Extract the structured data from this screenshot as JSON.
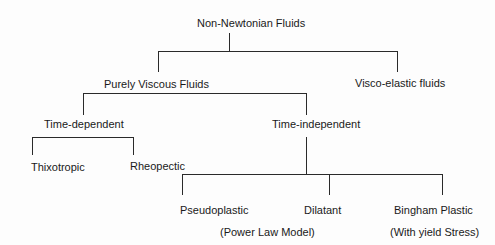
{
  "diagram": {
    "type": "tree",
    "root": {
      "label": "Non-Newtonian Fluids",
      "children": [
        {
          "label": "Purely Viscous Fluids",
          "children": [
            {
              "label": "Time-dependent",
              "children": [
                {
                  "label": "Thixotropic"
                },
                {
                  "label": "Rheopectic"
                }
              ]
            },
            {
              "label": "Time-independent",
              "children": [
                {
                  "label": "Pseudoplastic",
                  "note": "(Power Law Model)"
                },
                {
                  "label": "Dilatant"
                },
                {
                  "label": "Bingham Plastic",
                  "note": "(With yield Stress)"
                }
              ]
            }
          ]
        },
        {
          "label": "Visco-elastic fluids"
        }
      ]
    }
  },
  "nodes": {
    "root": "Non-Newtonian Fluids",
    "purely_viscous": "Purely Viscous Fluids",
    "visco_elastic": "Visco-elastic fluids",
    "time_dependent": "Time-dependent",
    "time_independent": "Time-independent",
    "thixotropic": "Thixotropic",
    "rheopectic": "Rheopectic",
    "pseudoplastic": "Pseudoplastic",
    "pseudoplastic_note": "(Power Law Model)",
    "dilatant": "Dilatant",
    "bingham": "Bingham Plastic",
    "bingham_note": "(With yield Stress)"
  },
  "colors": {
    "line": "#2a2a2a",
    "text": "#1a1a1a",
    "background": "#fdfdfd"
  }
}
